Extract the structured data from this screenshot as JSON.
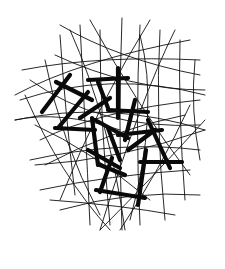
{
  "artwork": {
    "title": "",
    "description": "Abstract black ink drawing of tangled thin curved lines with overlapping thick bold stroke shapes",
    "colors": {
      "ink": "#0a0a0a",
      "background": "#ffffff"
    }
  }
}
